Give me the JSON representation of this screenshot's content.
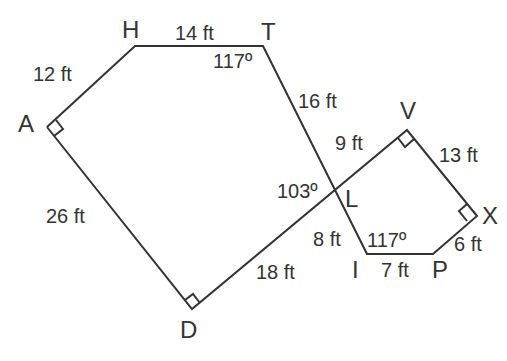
{
  "diagram": {
    "vertices": {
      "H": {
        "label": "H",
        "x": 135,
        "y": 46
      },
      "T": {
        "label": "T",
        "x": 263,
        "y": 46
      },
      "A": {
        "label": "A",
        "x": 47,
        "y": 127
      },
      "D": {
        "label": "D",
        "x": 192,
        "y": 309
      },
      "L": {
        "label": "L",
        "x": 335,
        "y": 190
      },
      "V": {
        "label": "V",
        "x": 407,
        "y": 130
      },
      "X": {
        "label": "X",
        "x": 477,
        "y": 216
      },
      "P": {
        "label": "P",
        "x": 433,
        "y": 254
      },
      "I": {
        "label": "I",
        "x": 367,
        "y": 254
      }
    },
    "measurements": {
      "AH": "12 ft",
      "HT": "14 ft",
      "TL": "16 ft",
      "LV": "9 ft",
      "VX": "13 ft",
      "XP": "6 ft",
      "PI": "7 ft",
      "IL": "8 ft",
      "LD": "18 ft",
      "DA": "26 ft"
    },
    "angles": {
      "T": "117º",
      "L": "103º",
      "I": "117º"
    },
    "right_angles": [
      "A",
      "D",
      "V",
      "X"
    ],
    "stroke_color": "#333333"
  }
}
